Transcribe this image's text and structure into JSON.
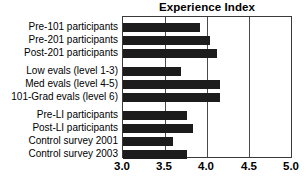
{
  "chart_data": {
    "type": "bar",
    "orientation": "horizontal",
    "title": "Experience Index",
    "xlabel": "",
    "ylabel": "",
    "xlim": [
      3.0,
      5.0
    ],
    "xticks": [
      "3.0",
      "3.5",
      "4.0",
      "4.5",
      "5.0"
    ],
    "xtick_values": [
      3.0,
      3.5,
      4.0,
      4.5,
      5.0
    ],
    "grid": true,
    "grid_axis": "x",
    "legend": false,
    "bar_color": "#1c1c1c",
    "categories": [
      "Pre-101 participants",
      "Pre-201 participants",
      "Post-201 participants",
      "Low evals (level 1-3)",
      "Med evals (level 4-5)",
      "101-Grad evals (level 6)",
      "Pre-LI participants",
      "Post-LI participants",
      "Control survey 2001",
      "Control survey 2003"
    ],
    "values": [
      3.92,
      4.04,
      4.12,
      3.69,
      4.16,
      4.16,
      3.76,
      3.83,
      3.59,
      3.76
    ],
    "groups": [
      {
        "name": "course-participants",
        "categories": [
          0,
          1,
          2
        ]
      },
      {
        "name": "evaluation-levels",
        "categories": [
          3,
          4,
          5
        ]
      },
      {
        "name": "li-and-control",
        "categories": [
          6,
          7,
          8,
          9
        ]
      }
    ]
  }
}
